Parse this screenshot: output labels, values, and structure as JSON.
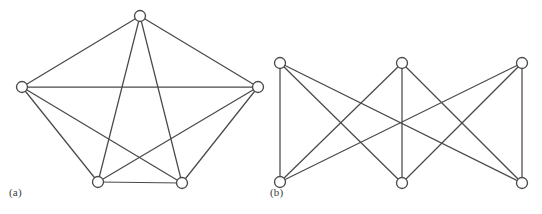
{
  "figure": {
    "background_color": "#ffffff",
    "stroke_color": "#4a4a4a",
    "vertex_fill_color": "#ffffff",
    "width": 542,
    "height": 214
  },
  "panels": [
    {
      "id": "panel-a",
      "label": "(a)",
      "label_x": 9,
      "label_y": 186,
      "graph_name": "K5",
      "vertices": [
        {
          "id": "a-top",
          "name": "vertex-top",
          "cx": 140,
          "cy": 16,
          "r": 5.5
        },
        {
          "id": "a-left",
          "name": "vertex-left",
          "cx": 22,
          "cy": 87,
          "r": 5.5
        },
        {
          "id": "a-right",
          "name": "vertex-right",
          "cx": 258,
          "cy": 87,
          "r": 5.5
        },
        {
          "id": "a-bottom-left",
          "name": "vertex-bottom-left",
          "cx": 98,
          "cy": 182,
          "r": 5.5
        },
        {
          "id": "a-bottom-right",
          "name": "vertex-bottom-right",
          "cx": 182,
          "cy": 183,
          "r": 5.5
        }
      ],
      "edges": [
        {
          "from": "a-top",
          "to": "a-left"
        },
        {
          "from": "a-top",
          "to": "a-right"
        },
        {
          "from": "a-top",
          "to": "a-bottom-left"
        },
        {
          "from": "a-top",
          "to": "a-bottom-right"
        },
        {
          "from": "a-left",
          "to": "a-right"
        },
        {
          "from": "a-left",
          "to": "a-bottom-left"
        },
        {
          "from": "a-left",
          "to": "a-bottom-right"
        },
        {
          "from": "a-right",
          "to": "a-bottom-left"
        },
        {
          "from": "a-right",
          "to": "a-bottom-right"
        },
        {
          "from": "a-bottom-left",
          "to": "a-bottom-right"
        }
      ]
    },
    {
      "id": "panel-b",
      "label": "(b)",
      "label_x": 270,
      "label_y": 186,
      "graph_name": "K3,3",
      "vertices": [
        {
          "id": "b-top-left",
          "name": "vertex-top-left",
          "cx": 280,
          "cy": 63,
          "r": 5.5
        },
        {
          "id": "b-top-middle",
          "name": "vertex-top-middle",
          "cx": 402,
          "cy": 63,
          "r": 5.5
        },
        {
          "id": "b-top-right",
          "name": "vertex-top-right",
          "cx": 522,
          "cy": 63,
          "r": 5.5
        },
        {
          "id": "b-bot-left",
          "name": "vertex-bottom-left",
          "cx": 280,
          "cy": 182,
          "r": 5.5
        },
        {
          "id": "b-bot-middle",
          "name": "vertex-bottom-middle",
          "cx": 402,
          "cy": 183,
          "r": 5.5
        },
        {
          "id": "b-bot-right",
          "name": "vertex-bottom-right",
          "cx": 522,
          "cy": 183,
          "r": 5.5
        }
      ],
      "edges": [
        {
          "from": "b-top-left",
          "to": "b-bot-left"
        },
        {
          "from": "b-top-left",
          "to": "b-bot-middle"
        },
        {
          "from": "b-top-left",
          "to": "b-bot-right"
        },
        {
          "from": "b-top-middle",
          "to": "b-bot-left"
        },
        {
          "from": "b-top-middle",
          "to": "b-bot-middle"
        },
        {
          "from": "b-top-middle",
          "to": "b-bot-right"
        },
        {
          "from": "b-top-right",
          "to": "b-bot-left"
        },
        {
          "from": "b-top-right",
          "to": "b-bot-middle"
        },
        {
          "from": "b-top-right",
          "to": "b-bot-right"
        }
      ]
    }
  ]
}
